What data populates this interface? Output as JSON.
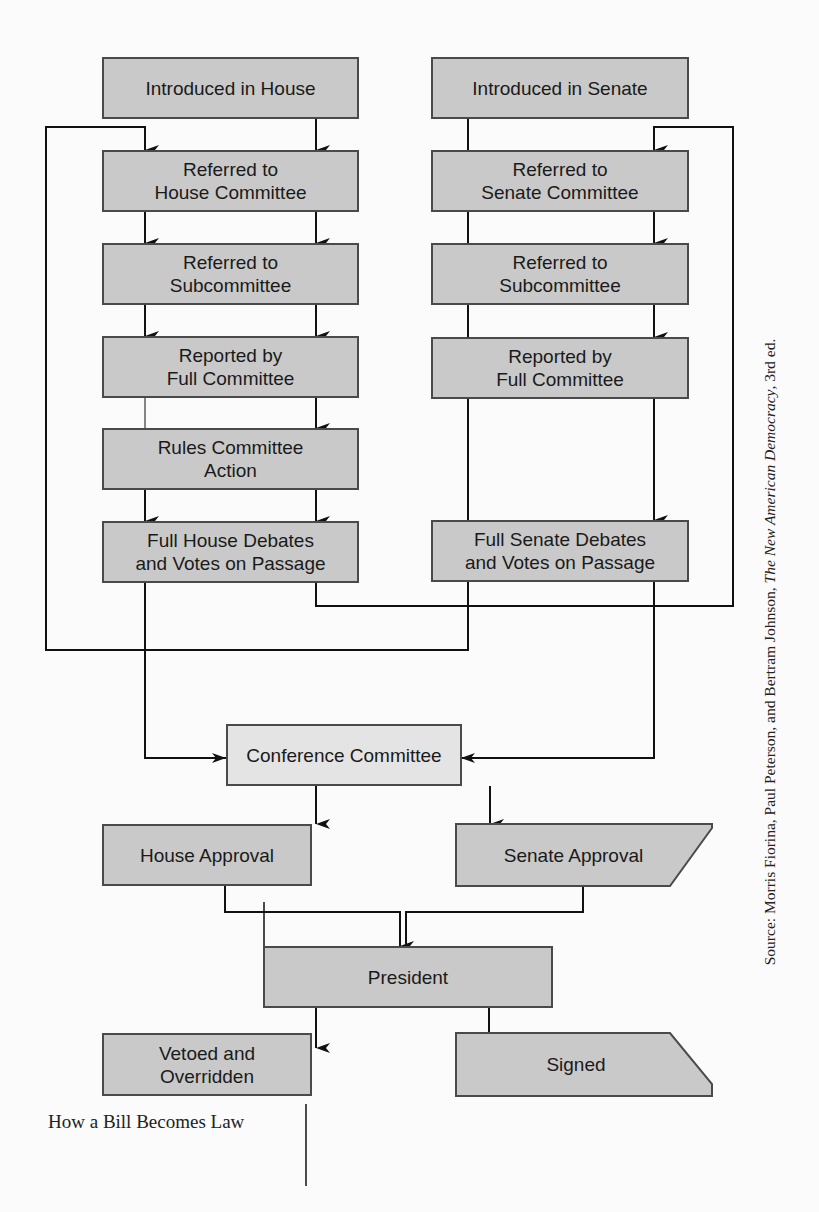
{
  "title": "How a Bill Becomes Law",
  "source": {
    "prefix": "Source: Morris Fiorina, Paul Peterson, and Bertram Johnson, ",
    "book_title": "The New American Democracy",
    "suffix": ", 3rd ed."
  },
  "house_column": [
    {
      "label": "Introduced in House"
    },
    {
      "label": "Referred to\nHouse Committee"
    },
    {
      "label": "Referred to\nSubcommittee"
    },
    {
      "label": "Reported by\nFull Committee"
    },
    {
      "label": "Rules Committee\nAction"
    },
    {
      "label": "Full House Debates\nand Votes on Passage"
    }
  ],
  "senate_column": [
    {
      "label": "Introduced in Senate"
    },
    {
      "label": "Referred to\nSenate Committee"
    },
    {
      "label": "Referred to\nSubcommittee"
    },
    {
      "label": "Reported by\nFull Committee"
    },
    {
      "label": "Full Senate Debates\nand Votes on Passage"
    }
  ],
  "conference": {
    "label": "Conference Committee"
  },
  "approvals": {
    "house": {
      "label": "House Approval"
    },
    "senate": {
      "label": "Senate Approval"
    }
  },
  "president": {
    "label": "President"
  },
  "outcomes": {
    "vetoed": {
      "label": "Vetoed and\nOverridden"
    },
    "signed": {
      "label": "Signed"
    }
  },
  "colors": {
    "box_fill": "#c9c9c9",
    "conference_fill": "#e4e4e4",
    "border": "#4a4a4a",
    "line": "#111111"
  }
}
